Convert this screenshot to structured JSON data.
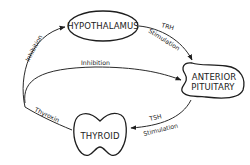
{
  "diagram": {
    "type": "feedback-loop",
    "colors": {
      "line": "#2a2a2a",
      "text": "#222222",
      "background": "#ffffff"
    },
    "nodes": {
      "hypothalamus": {
        "label": "HYPOTHALAMUS",
        "shape": "ellipse"
      },
      "anterior_pituitary": {
        "line1": "ANTERIOR",
        "line2": "PITUITARY",
        "shape": "blob"
      },
      "thyroid": {
        "label": "THYROID",
        "shape": "thyroid-gland"
      }
    },
    "edges": {
      "trh": {
        "from": "hypothalamus",
        "to": "anterior_pituitary",
        "hormone": "TRH",
        "effect": "Stimulation"
      },
      "tsh": {
        "from": "anterior_pituitary",
        "to": "thyroid",
        "hormone": "TSH",
        "effect": "Stimulation"
      },
      "thyroxin": {
        "from": "thyroid",
        "label": "Thyroxin"
      },
      "inhibition_pituitary": {
        "to": "anterior_pituitary",
        "label": "Inhibition"
      },
      "inhibition_hypothalamus": {
        "to": "hypothalamus",
        "label": "Inhibition"
      }
    }
  }
}
